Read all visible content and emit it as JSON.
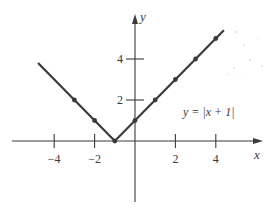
{
  "chart_data": {
    "type": "line",
    "title": "",
    "equation_label": "y = |x + 1|",
    "xlabel": "x",
    "ylabel": "y",
    "xlim": [
      -5,
      5.5
    ],
    "ylim": [
      -3,
      6
    ],
    "x_ticks": [
      -4,
      -2,
      2,
      4
    ],
    "x_tick_labels": [
      "−4",
      "−2",
      "2",
      "4"
    ],
    "y_ticks": [
      2,
      4
    ],
    "y_tick_labels": [
      "2",
      "4"
    ],
    "grid": false,
    "legend": null,
    "series": [
      {
        "name": "y = |x + 1|",
        "line_x": [
          -4.8,
          -1,
          4.4
        ],
        "line_y": [
          3.8,
          0,
          5.4
        ],
        "points_x": [
          -3,
          -2,
          -1,
          0,
          1,
          2,
          3,
          4
        ],
        "points_y": [
          2,
          1,
          0,
          1,
          2,
          3,
          4,
          5
        ],
        "color": "#3a3a3a"
      }
    ]
  },
  "style": {
    "line_color": "#3a3a3a",
    "axis_color": "#3a3a3a",
    "background": "#ffffff"
  }
}
